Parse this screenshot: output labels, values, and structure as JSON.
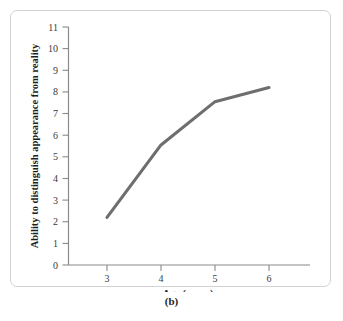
{
  "figure": {
    "caption": "(b)"
  },
  "chart_data": {
    "type": "line",
    "title": "",
    "xlabel": "Age (years)",
    "ylabel": "Ability to distinguish appearance from reality",
    "x": [
      3,
      4,
      5,
      6
    ],
    "values": [
      2.2,
      5.55,
      7.55,
      8.2
    ],
    "xticks": [
      "3",
      "4",
      "5",
      "6"
    ],
    "yticks": [
      "0",
      "1",
      "2",
      "3",
      "4",
      "5",
      "6",
      "7",
      "8",
      "9",
      "10",
      "11"
    ],
    "xlim": [
      2.4,
      6.9
    ],
    "ylim": [
      0,
      11
    ],
    "grid": false,
    "legend": null,
    "line_color": "#6e6e6e",
    "axis_color": "#8a8a8a",
    "frame_color": "#d2d2d2"
  }
}
